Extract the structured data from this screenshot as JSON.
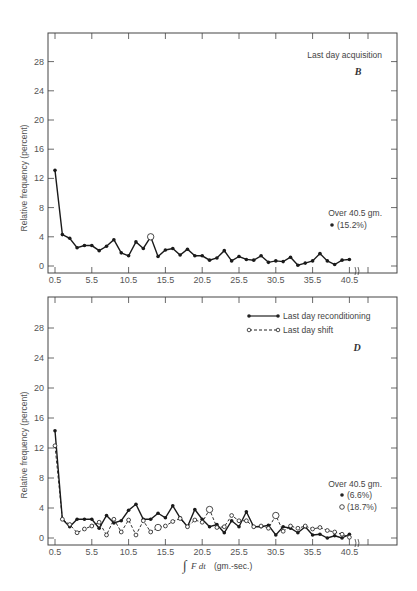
{
  "chart_data": [
    {
      "type": "line",
      "panel": "B",
      "title": "Last day acquisition",
      "xlabel": "",
      "ylabel": "Relative frequency (percent)",
      "ylim": [
        0,
        30
      ],
      "yticks": [
        0,
        4,
        8,
        12,
        16,
        20,
        24,
        28
      ],
      "xtick_labels": [
        "0.5",
        "5.5",
        "10.5",
        "15.5",
        "20.5",
        "25.5",
        "30.5",
        "35.5",
        "40.5"
      ],
      "x": [
        0.5,
        1.5,
        2.5,
        3.5,
        4.5,
        5.5,
        6.5,
        7.5,
        8.5,
        9.5,
        10.5,
        11.5,
        12.5,
        13.5,
        14.5,
        15.5,
        16.5,
        17.5,
        18.5,
        19.5,
        20.5,
        21.5,
        22.5,
        23.5,
        24.5,
        25.5,
        26.5,
        27.5,
        28.5,
        29.5,
        30.5,
        31.5,
        32.5,
        33.5,
        34.5,
        35.5,
        36.5,
        37.5,
        38.5,
        39.5,
        40.5
      ],
      "series": [
        {
          "name": "Last day acquisition",
          "marker": "filled",
          "values": [
            13.1,
            4.3,
            3.8,
            2.5,
            2.8,
            2.8,
            2.1,
            2.7,
            3.6,
            1.8,
            1.4,
            3.3,
            2.4,
            4.0,
            1.3,
            2.2,
            2.4,
            1.5,
            2.3,
            1.4,
            1.4,
            0.8,
            1.1,
            2.1,
            0.7,
            1.3,
            0.9,
            0.8,
            1.4,
            0.5,
            0.7,
            0.6,
            1.2,
            0.1,
            0.4,
            0.7,
            1.7,
            0.7,
            0.2,
            0.8,
            0.9
          ],
          "open_marker_index": 13
        }
      ],
      "annotations": [
        {
          "text": "Over 40.5 gm.",
          "value": "(15.2%)",
          "marker": "filled"
        }
      ],
      "grid": false,
      "legend_position": "none"
    },
    {
      "type": "line",
      "panel": "D",
      "title": "",
      "xlabel": "∫ F dt (gm.-sec.)",
      "ylabel": "Relative frequency (percent)",
      "ylim": [
        0,
        30
      ],
      "yticks": [
        0,
        4,
        8,
        12,
        16,
        20,
        24,
        28
      ],
      "xtick_labels": [
        "0.5",
        "5.5",
        "10.5",
        "15.5",
        "20.5",
        "25.5",
        "30.5",
        "35.5",
        "40.5"
      ],
      "x": [
        0.5,
        1.5,
        2.5,
        3.5,
        4.5,
        5.5,
        6.5,
        7.5,
        8.5,
        9.5,
        10.5,
        11.5,
        12.5,
        13.5,
        14.5,
        15.5,
        16.5,
        17.5,
        18.5,
        19.5,
        20.5,
        21.5,
        22.5,
        23.5,
        24.5,
        25.5,
        26.5,
        27.5,
        28.5,
        29.5,
        30.5,
        31.5,
        32.5,
        33.5,
        34.5,
        35.5,
        36.5,
        37.5,
        38.5,
        39.5,
        40.5
      ],
      "series": [
        {
          "name": "Last day reconditioning",
          "marker": "filled",
          "line": "solid",
          "values": [
            14.3,
            2.5,
            1.5,
            2.5,
            2.5,
            2.5,
            1.3,
            3.0,
            2.0,
            2.3,
            3.7,
            4.5,
            2.5,
            2.5,
            3.3,
            2.7,
            4.3,
            2.7,
            1.5,
            3.8,
            2.5,
            1.5,
            1.8,
            0.7,
            2.3,
            1.5,
            3.5,
            1.5,
            1.5,
            1.7,
            0.4,
            1.5,
            1.3,
            0.7,
            1.5,
            0.4,
            0.5,
            0.0,
            0.3,
            0.0,
            0.5
          ]
        },
        {
          "name": "Last day shift",
          "marker": "open",
          "line": "dashed",
          "values": [
            12.3,
            2.5,
            1.8,
            0.7,
            1.2,
            1.6,
            2.1,
            0.4,
            2.5,
            0.8,
            2.4,
            0.4,
            2.3,
            0.8,
            1.4,
            1.6,
            2.2,
            2.6,
            1.5,
            2.4,
            2.1,
            3.8,
            1.4,
            1.5,
            3.0,
            2.3,
            2.3,
            1.5,
            1.6,
            1.3,
            3.0,
            0.9,
            1.6,
            1.3,
            1.6,
            1.2,
            1.4,
            1.0,
            0.8,
            0.5,
            0.1
          ],
          "large_marker_indices": [
            14,
            21,
            30
          ]
        }
      ],
      "annotations": [
        {
          "text": "Over 40.5 gm.",
          "value": "(6.6%)",
          "marker": "filled",
          "series": "Last day reconditioning"
        },
        {
          "text": "",
          "value": "(18.7%)",
          "marker": "open",
          "series": "Last day shift"
        }
      ],
      "legend": [
        "Last day reconditioning",
        "Last day shift"
      ],
      "grid": false,
      "legend_position": "upper right"
    }
  ],
  "panels": {
    "top": {
      "label": "Last day acquisition",
      "letter": "B",
      "ylabel": "Relative frequency (percent)",
      "over_label": "Over 40.5 gm.",
      "over_value": "(15.2%)"
    },
    "bottom": {
      "letter": "D",
      "ylabel": "Relative frequency (percent)",
      "legend_solid": "Last day reconditioning",
      "legend_dashed": "Last day shift",
      "over_label": "Over 40.5 gm.",
      "over_value_solid": "(6.6%)",
      "over_value_open": "(18.7%)",
      "xlabel_integral": "∫",
      "xlabel_expr": "F dt",
      "xlabel_units": "(gm.-sec.)"
    }
  }
}
